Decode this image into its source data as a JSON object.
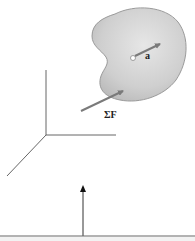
{
  "diagram": {
    "body": {
      "fill": "#cfcfcf",
      "stroke": "#9a9a9a"
    },
    "vectors": {
      "acceleration": {
        "label": "a",
        "color": "#7a7a7a"
      },
      "net_force": {
        "label": "ΣF",
        "color": "#7a7a7a"
      },
      "vertical_arrow": {
        "color": "#333333"
      }
    },
    "axes": {
      "color": "#555555"
    },
    "ground_line": {
      "color": "#666666"
    }
  }
}
